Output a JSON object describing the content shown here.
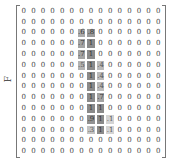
{
  "side_label": "F",
  "matrix": {
    "rows": 14,
    "cols": 15,
    "values": [
      [
        "0",
        "0",
        "0",
        "0",
        "0",
        "0",
        "0",
        "0",
        "0",
        "0",
        "0",
        "0",
        "0",
        "0",
        "0"
      ],
      [
        "0",
        "0",
        "0",
        "0",
        "0",
        "0",
        "0",
        "0",
        "0",
        "0",
        "0",
        "0",
        "0",
        "0",
        "0"
      ],
      [
        "0",
        "0",
        "0",
        "0",
        "0",
        "0",
        ".6",
        ".8",
        "0",
        "0",
        "0",
        "0",
        "0",
        "0",
        "0"
      ],
      [
        "0",
        "0",
        "0",
        "0",
        "0",
        "0",
        ".7",
        "1",
        "0",
        "0",
        "0",
        "0",
        "0",
        "0",
        "0"
      ],
      [
        "0",
        "0",
        "0",
        "0",
        "0",
        "0",
        ".7",
        "1",
        "0",
        "0",
        "0",
        "0",
        "0",
        "0",
        "0"
      ],
      [
        "0",
        "0",
        "0",
        "0",
        "0",
        "0",
        ".5",
        "1",
        ".4",
        "0",
        "0",
        "0",
        "0",
        "0",
        "0"
      ],
      [
        "0",
        "0",
        "0",
        "0",
        "0",
        "0",
        "0",
        "1",
        ".4",
        "0",
        "0",
        "0",
        "0",
        "0",
        "0"
      ],
      [
        "0",
        "0",
        "0",
        "0",
        "0",
        "0",
        "0",
        "1",
        ".4",
        "0",
        "0",
        "0",
        "0",
        "0",
        "0"
      ],
      [
        "0",
        "0",
        "0",
        "0",
        "0",
        "0",
        "0",
        "1",
        ".7",
        "0",
        "0",
        "0",
        "0",
        "0",
        "0"
      ],
      [
        "0",
        "0",
        "0",
        "0",
        "0",
        "0",
        "0",
        "1",
        "1",
        "0",
        "0",
        "0",
        "0",
        "0",
        "0"
      ],
      [
        "0",
        "0",
        "0",
        "0",
        "0",
        "0",
        "0",
        ".9",
        "1",
        ".1",
        "0",
        "0",
        "0",
        "0",
        "0"
      ],
      [
        "0",
        "0",
        "0",
        "0",
        "0",
        "0",
        "0",
        ".3",
        "1",
        ".1",
        "0",
        "0",
        "0",
        "0",
        "0"
      ],
      [
        "0",
        "0",
        "0",
        "0",
        "0",
        "0",
        "0",
        "0",
        "0",
        "0",
        "0",
        "0",
        "0",
        "0",
        "0"
      ],
      [
        "0",
        "0",
        "0",
        "0",
        "0",
        "0",
        "0",
        "0",
        "0",
        "0",
        "0",
        "0",
        "0",
        "0",
        "0"
      ]
    ],
    "highlight_scale": {
      "low": "#dcdcdc",
      "high": "#8a8a8a"
    }
  }
}
